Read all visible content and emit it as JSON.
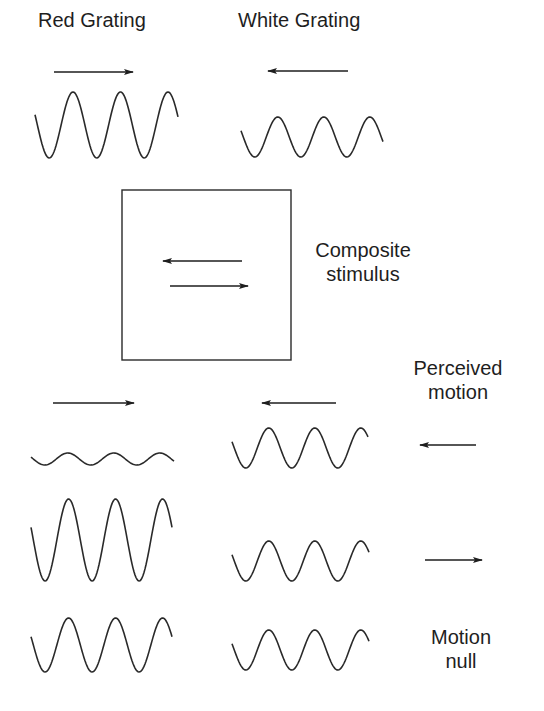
{
  "titles": {
    "red_grating": "Red Grating",
    "white_grating": "White Grating",
    "composite_line1": "Composite",
    "composite_line2": "stimulus",
    "perceived_line1": "Perceived",
    "perceived_line2": "motion",
    "null_line1": "Motion",
    "null_line2": "null"
  },
  "colors": {
    "ink": "#2a2a2a",
    "background": "#ffffff"
  },
  "top": {
    "red": {
      "direction": "right",
      "arrow": {
        "x1": 54,
        "x2": 133,
        "y": 72
      },
      "wave": {
        "x0": 35,
        "x1": 178,
        "cy": 125,
        "amp": 33,
        "period": 47.5,
        "phase": 0.45
      }
    },
    "white": {
      "direction": "left",
      "arrow": {
        "x1": 268,
        "x2": 348,
        "y": 71
      },
      "wave": {
        "x0": 241,
        "x1": 383,
        "cy": 137,
        "amp": 20,
        "period": 46,
        "phase": 0.45
      }
    }
  },
  "composite_box": {
    "x": 122,
    "y": 190,
    "w": 169,
    "h": 170,
    "arrows": [
      {
        "direction": "left",
        "x1": 163,
        "x2": 242,
        "y": 261
      },
      {
        "direction": "right",
        "x1": 170,
        "x2": 248,
        "y": 286
      }
    ]
  },
  "rows": [
    {
      "name": "row-perceived-left",
      "red_arrow": {
        "direction": "right",
        "x1": 53,
        "x2": 134,
        "y": 403
      },
      "white_arrow": {
        "direction": "left",
        "x1": 262,
        "x2": 336,
        "y": 403
      },
      "red_wave": {
        "x0": 31,
        "x1": 174,
        "cy": 459,
        "amp": 6,
        "period": 46,
        "phase": 0.45
      },
      "white_wave": {
        "x0": 232,
        "x1": 368,
        "cy": 448,
        "amp": 20,
        "period": 46,
        "phase": 0.45
      },
      "perceived": {
        "direction": "left",
        "x1": 420,
        "x2": 476,
        "y": 445
      }
    },
    {
      "name": "row-perceived-right",
      "red_wave": {
        "x0": 31,
        "x1": 172,
        "cy": 540,
        "amp": 41,
        "period": 47,
        "phase": 0.45
      },
      "white_wave": {
        "x0": 232,
        "x1": 369,
        "cy": 561,
        "amp": 20,
        "period": 46,
        "phase": 0.45
      },
      "perceived": {
        "direction": "right",
        "x1": 425,
        "x2": 482,
        "y": 560
      }
    },
    {
      "name": "row-motion-null",
      "red_wave": {
        "x0": 31,
        "x1": 172,
        "cy": 645,
        "amp": 27,
        "period": 47,
        "phase": 0.45
      },
      "white_wave": {
        "x0": 232,
        "x1": 369,
        "cy": 650,
        "amp": 20,
        "period": 46,
        "phase": 0.45
      },
      "perceived": null
    }
  ]
}
